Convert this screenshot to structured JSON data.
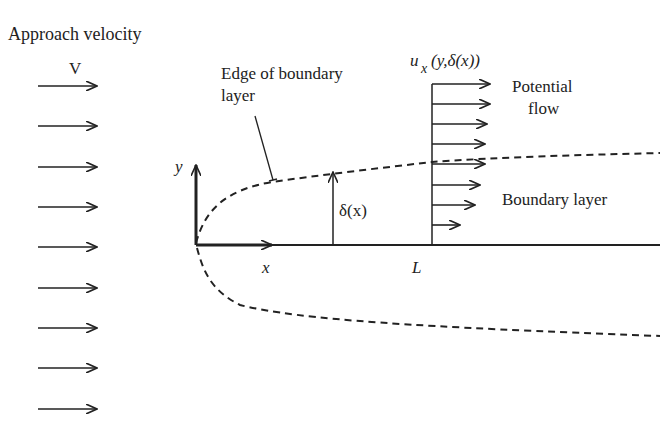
{
  "labels": {
    "approach_velocity": "Approach velocity",
    "velocity_symbol": "V",
    "edge_label_line1": "Edge of boundary",
    "edge_label_line2": "layer",
    "profile_u": "u",
    "profile_sub": "x",
    "profile_args": "(y,δ(x))",
    "potential_line1": "Potential",
    "potential_line2": "flow",
    "boundary_layer": "Boundary layer",
    "y_axis": "y",
    "x_axis": "x",
    "delta": "δ(x)",
    "length": "L"
  },
  "colors": {
    "ink": "#222222",
    "background": "#ffffff"
  },
  "approach_arrows_y": [
    86,
    126,
    167,
    207,
    247,
    288,
    328,
    368,
    409
  ],
  "profile_arrows": [
    {
      "y": 84,
      "x_end": 490
    },
    {
      "y": 104,
      "x_end": 490
    },
    {
      "y": 124,
      "x_end": 487
    },
    {
      "y": 144,
      "x_end": 485
    },
    {
      "y": 164,
      "x_end": 485
    },
    {
      "y": 185,
      "x_end": 480
    },
    {
      "y": 205,
      "x_end": 475
    },
    {
      "y": 225,
      "x_end": 460
    }
  ]
}
